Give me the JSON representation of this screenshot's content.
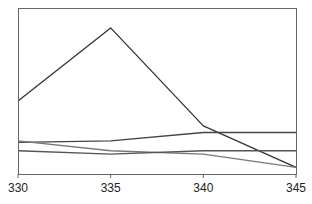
{
  "chart_data": {
    "type": "line",
    "title": "",
    "xlabel": "",
    "ylabel": "",
    "x": [
      330,
      335,
      340,
      345
    ],
    "xticks": [
      "330",
      "335",
      "340",
      "345"
    ],
    "xlim": [
      330,
      345
    ],
    "ylim": [
      0,
      100
    ],
    "y_axis_labels_visible": false,
    "grid": false,
    "legend": null,
    "series": [
      {
        "name": "series-1",
        "values": [
          44,
          88,
          29,
          4
        ],
        "color": "#333333"
      },
      {
        "name": "series-2",
        "values": [
          19,
          20,
          25,
          25
        ],
        "color": "#444444"
      },
      {
        "name": "series-3",
        "values": [
          20,
          14,
          12,
          4
        ],
        "color": "#777777"
      },
      {
        "name": "series-4",
        "values": [
          14,
          12,
          14,
          14
        ],
        "color": "#555555"
      }
    ]
  },
  "layout": {
    "plot": {
      "left": 18,
      "top": 8,
      "right": 296,
      "bottom": 174
    },
    "frame_color": "#666666"
  }
}
